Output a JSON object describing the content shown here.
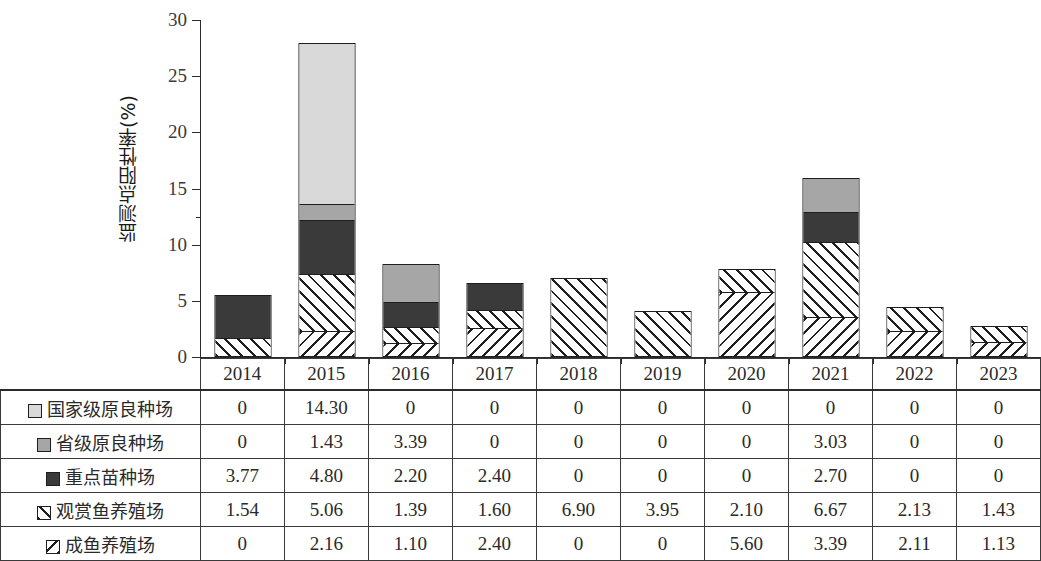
{
  "chart_data": {
    "type": "bar",
    "stacked": true,
    "title": "",
    "xlabel": "",
    "ylabel": "监测点阳性率(%)",
    "ylim": [
      0,
      30
    ],
    "yticks": [
      0,
      5,
      10,
      15,
      20,
      25,
      30
    ],
    "ytick_labels": [
      "0",
      "5",
      "10",
      "15",
      "20",
      "25",
      "30"
    ],
    "grid": false,
    "legend_position": "table-row-headers",
    "categories": [
      "2014",
      "2015",
      "2016",
      "2017",
      "2018",
      "2019",
      "2020",
      "2021",
      "2022",
      "2023"
    ],
    "series": [
      {
        "name": "成鱼养殖场",
        "swatch": "backslash-hatch-swatch",
        "pattern": "bslash",
        "values": [
          0,
          2.16,
          1.1,
          2.4,
          0,
          0,
          5.6,
          3.39,
          2.11,
          1.13
        ],
        "display": [
          "0",
          "2.16",
          "1.10",
          "2.40",
          "0",
          "0",
          "5.60",
          "3.39",
          "2.11",
          "1.13"
        ]
      },
      {
        "name": "观赏鱼养殖场",
        "swatch": "forward-slash-hatch-swatch",
        "pattern": "fslash",
        "values": [
          1.54,
          5.06,
          1.39,
          1.6,
          6.9,
          3.95,
          2.1,
          6.67,
          2.13,
          1.43
        ],
        "display": [
          "1.54",
          "5.06",
          "1.39",
          "1.60",
          "6.90",
          "3.95",
          "2.10",
          "6.67",
          "2.13",
          "1.43"
        ]
      },
      {
        "name": "重点苗种场",
        "swatch": "dark-fill-swatch",
        "pattern": "dark",
        "values": [
          3.77,
          4.8,
          2.2,
          2.4,
          0,
          0,
          0,
          2.7,
          0,
          0
        ],
        "display": [
          "3.77",
          "4.80",
          "2.20",
          "2.40",
          "0",
          "0",
          "0",
          "2.70",
          "0",
          "0"
        ]
      },
      {
        "name": "省级原良种场",
        "swatch": "medium-gray-fill-swatch",
        "pattern": "medium",
        "values": [
          0,
          1.43,
          3.39,
          0,
          0,
          0,
          0,
          3.03,
          0,
          0
        ],
        "display": [
          "0",
          "1.43",
          "3.39",
          "0",
          "0",
          "0",
          "0",
          "3.03",
          "0",
          "0"
        ]
      },
      {
        "name": "国家级原良种场",
        "swatch": "light-gray-fill-swatch",
        "pattern": "light",
        "values": [
          0,
          14.3,
          0,
          0,
          0,
          0,
          0,
          0,
          0,
          0
        ],
        "display": [
          "0",
          "14.30",
          "0",
          "0",
          "0",
          "0",
          "0",
          "0",
          "0",
          "0"
        ]
      }
    ],
    "stack_order_bottom_to_top": [
      "成鱼养殖场",
      "观赏鱼养殖场",
      "重点苗种场",
      "省级原良种场",
      "国家级原良种场"
    ],
    "totals": [
      5.31,
      27.75,
      8.08,
      6.4,
      6.9,
      3.95,
      7.7,
      15.79,
      4.24,
      2.56
    ],
    "table_row_order_top_to_bottom": [
      "国家级原良种场",
      "省级原良种场",
      "重点苗种场",
      "观赏鱼养殖场",
      "成鱼养殖场"
    ],
    "colors": {
      "light": "#d9d9d9",
      "medium": "#a6a6a6",
      "dark": "#3a3a3a",
      "hatch_line": "#1e1e1e",
      "axis": "#2b2b2b",
      "text": "#2a2a2a"
    }
  }
}
